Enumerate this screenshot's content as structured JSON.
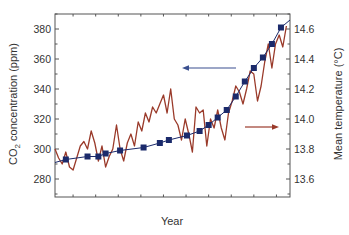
{
  "chart_data": {
    "type": "line",
    "title": "",
    "xlabel": "Year",
    "ylabel_left": "CO2 concentration (ppm)",
    "ylabel_right": "Mean temperature (°C)",
    "xlim": [
      1880,
      2010
    ],
    "ylim_left": [
      270,
      390
    ],
    "ylim_right": [
      13.53,
      14.67
    ],
    "x_ticks": [
      1900,
      1925,
      1950,
      1975,
      2000
    ],
    "y_ticks_left": [
      280,
      300,
      320,
      340,
      360,
      380
    ],
    "y_ticks_right": [
      13.6,
      13.8,
      14.0,
      14.2,
      14.4,
      14.6
    ],
    "grid": false,
    "annotations": [
      {
        "type": "arrow",
        "direction": "left",
        "color": "#3a4f8f",
        "meaning": "blue series uses left axis (CO2)"
      },
      {
        "type": "arrow",
        "direction": "right",
        "color": "#9a3a2a",
        "meaning": "brown series uses right axis (temperature)"
      }
    ],
    "series": [
      {
        "name": "CO2 concentration (ppm)",
        "axis": "left",
        "color": "#1b2a6b",
        "marker": "square",
        "x": [
          1886,
          1898,
          1904,
          1908,
          1916,
          1929,
          1938,
          1943,
          1953,
          1960,
          1965,
          1970,
          1975,
          1980,
          1985,
          1990,
          1995,
          2000,
          2005
        ],
        "values": [
          293,
          295,
          295,
          297,
          299,
          301,
          304,
          306,
          309,
          312,
          316,
          321,
          326,
          335,
          345,
          354,
          361,
          370,
          381
        ]
      },
      {
        "name": "Mean temperature (°C)",
        "axis": "right",
        "color": "#9a3a2a",
        "x": [
          1880,
          1882,
          1884,
          1886,
          1888,
          1890,
          1892,
          1894,
          1896,
          1898,
          1900,
          1902,
          1904,
          1906,
          1908,
          1910,
          1912,
          1914,
          1916,
          1918,
          1920,
          1922,
          1924,
          1926,
          1928,
          1930,
          1932,
          1934,
          1936,
          1938,
          1940,
          1942,
          1944,
          1946,
          1948,
          1950,
          1952,
          1954,
          1956,
          1958,
          1960,
          1962,
          1964,
          1966,
          1968,
          1970,
          1972,
          1974,
          1976,
          1978,
          1980,
          1982,
          1984,
          1986,
          1988,
          1990,
          1992,
          1994,
          1996,
          1998,
          2000,
          2002,
          2004,
          2006,
          2008
        ],
        "values": [
          13.8,
          13.74,
          13.7,
          13.78,
          13.68,
          13.66,
          13.74,
          13.82,
          13.85,
          13.8,
          13.92,
          13.84,
          13.72,
          13.82,
          13.68,
          13.75,
          13.8,
          13.96,
          13.8,
          13.72,
          13.84,
          13.9,
          13.82,
          13.98,
          13.92,
          14.04,
          13.98,
          14.08,
          14.04,
          14.1,
          14.16,
          14.04,
          14.2,
          14.0,
          13.96,
          13.86,
          14.0,
          13.9,
          13.78,
          14.08,
          14.04,
          14.06,
          13.82,
          14.0,
          13.94,
          14.06,
          13.94,
          13.86,
          14.04,
          14.12,
          14.22,
          14.18,
          14.1,
          14.2,
          14.32,
          14.3,
          14.12,
          14.22,
          14.38,
          14.5,
          14.34,
          14.5,
          14.56,
          14.48,
          14.62
        ]
      }
    ]
  }
}
